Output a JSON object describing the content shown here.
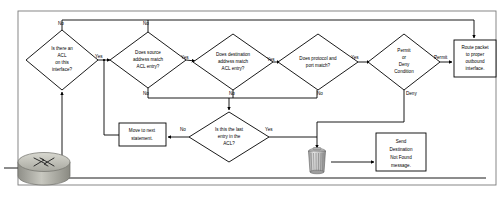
{
  "diagram": {
    "colors": {
      "stroke": "#000000",
      "fill": "#ffffff",
      "frame": "#7a7a7a",
      "router_body": "#b8b8b0",
      "trash_body": "#cfcfcf"
    },
    "nodes": [
      {
        "id": "acl-check",
        "type": "decision",
        "lines": [
          "Is there an",
          "ACL",
          "on this",
          "interface?"
        ],
        "cx": 62,
        "cy": 60,
        "rx": 36,
        "ry": 30
      },
      {
        "id": "source-match",
        "type": "decision",
        "lines": [
          "Does source",
          "address match",
          "ACL entry?"
        ],
        "cx": 148,
        "cy": 60,
        "rx": 38,
        "ry": 28
      },
      {
        "id": "destination-match",
        "type": "decision",
        "lines": [
          "Does destination",
          "address match",
          "ACL entry?"
        ],
        "cx": 233,
        "cy": 62,
        "rx": 40,
        "ry": 28
      },
      {
        "id": "protocol-port-match",
        "type": "decision",
        "lines": [
          "Does protocol and",
          "port match?"
        ],
        "cx": 318,
        "cy": 62,
        "rx": 40,
        "ry": 28
      },
      {
        "id": "permit-deny",
        "type": "decision",
        "lines": [
          "Permit",
          "or",
          "Deny",
          "Condition"
        ],
        "cx": 404,
        "cy": 62,
        "rx": 36,
        "ry": 28
      },
      {
        "id": "route-packet",
        "type": "process",
        "lines": [
          "Route packet",
          "to proper",
          "outbound",
          "interface."
        ],
        "x": 454,
        "y": 40,
        "w": 42,
        "h": 37
      },
      {
        "id": "last-entry",
        "type": "decision",
        "lines": [
          "Is this the last",
          "entry in the",
          "ACL?"
        ],
        "cx": 229,
        "cy": 137,
        "rx": 40,
        "ry": 25
      },
      {
        "id": "move-next",
        "type": "process",
        "lines": [
          "Move to next",
          "statement."
        ],
        "x": 119,
        "y": 123,
        "w": 47,
        "h": 23
      },
      {
        "id": "send-destination-not-found",
        "type": "process",
        "lines": [
          "Send",
          "Destination",
          "Not Found",
          "message."
        ],
        "x": 376,
        "y": 133,
        "w": 50,
        "h": 38
      },
      {
        "id": "discard-packet",
        "type": "trash-icon",
        "lines": [],
        "cx": 317,
        "cy": 160
      },
      {
        "id": "router",
        "type": "router-icon",
        "lines": [],
        "cx": 44,
        "cy": 168
      }
    ],
    "edge_labels": [
      {
        "id": "acl-no",
        "text": "No",
        "x": 58,
        "y": 24
      },
      {
        "id": "acl-yes",
        "text": "Yes",
        "x": 95,
        "y": 57
      },
      {
        "id": "source-no-top",
        "text": "No",
        "x": 143,
        "y": 24
      },
      {
        "id": "source-yes",
        "text": "Yes",
        "x": 181,
        "y": 58
      },
      {
        "id": "source-no-bottom",
        "text": "No",
        "x": 143,
        "y": 94
      },
      {
        "id": "destination-yes",
        "text": "Yes",
        "x": 267,
        "y": 60
      },
      {
        "id": "destination-no",
        "text": "No",
        "x": 229,
        "y": 94
      },
      {
        "id": "protocol-yes",
        "text": "Yes",
        "x": 351,
        "y": 58
      },
      {
        "id": "protocol-no",
        "text": "No",
        "x": 317,
        "y": 94
      },
      {
        "id": "permit",
        "text": "Permit",
        "x": 434,
        "y": 58
      },
      {
        "id": "deny",
        "text": "Deny",
        "x": 406,
        "y": 94
      },
      {
        "id": "last-entry-no",
        "text": "No",
        "x": 180,
        "y": 130
      },
      {
        "id": "last-entry-yes",
        "text": "Yes",
        "x": 265,
        "y": 130
      }
    ]
  }
}
